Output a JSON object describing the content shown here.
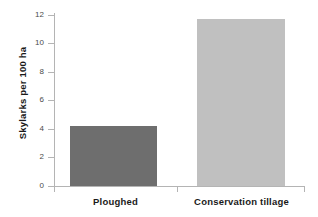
{
  "chart_data": {
    "type": "bar",
    "title": "",
    "subtitle": "",
    "xlabel": "",
    "ylabel": "Skylarks per 100 ha",
    "categories": [
      "Ploughed",
      "Conservation tillage"
    ],
    "values": [
      4.2,
      11.75
    ],
    "series": [
      {
        "name": "Skylark density",
        "values": [
          4.2,
          11.75
        ]
      }
    ],
    "ylim": [
      0,
      12
    ],
    "yticks": [
      0,
      2,
      4,
      6,
      8,
      10,
      12
    ],
    "ytick_labels": [
      "0",
      "2",
      "4",
      "6",
      "8",
      "10",
      "12"
    ],
    "grid": false,
    "legend": false,
    "legend_position": "none",
    "annotations": [],
    "bar_colors": [
      "#6e6e6e",
      "#c0c0c0"
    ]
  },
  "colors": {
    "background": "#ffffff",
    "axis": "#b4b4b4",
    "text": "#1a1a1a",
    "tick_text": "#4a4a4a",
    "bar_ploughed": "#6e6e6e",
    "bar_conservation": "#c0c0c0"
  }
}
